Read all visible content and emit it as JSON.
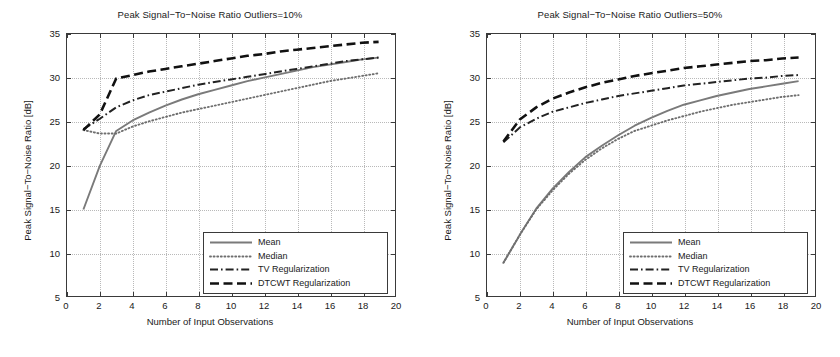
{
  "figure": {
    "width": 840,
    "height": 357,
    "background": "#ffffff"
  },
  "style": {
    "mean_color": "#7a7a7a",
    "median_color": "#6e6e6e",
    "tv_color": "#222222",
    "dtcwt_color": "#111111",
    "axis_color": "#3a3a3a",
    "grid_color": "#b9b9b9"
  },
  "axes": {
    "xlabel": "Number of Input Observations",
    "ylabel": "Peak Signal−To−Noise Ratio [dB]",
    "xlim": [
      0,
      20
    ],
    "ylim": [
      5,
      35
    ],
    "xticks": [
      0,
      2,
      4,
      6,
      8,
      10,
      12,
      14,
      16,
      18,
      20
    ],
    "yticks": [
      5,
      10,
      15,
      20,
      25,
      30,
      35
    ],
    "xtick_labels": [
      "0",
      "2",
      "4",
      "6",
      "8",
      "10",
      "12",
      "14",
      "16",
      "18",
      "20"
    ],
    "ytick_labels": [
      "5",
      "10",
      "15",
      "20",
      "25",
      "30",
      "35"
    ],
    "grid": true
  },
  "legend": {
    "position": "lower-right",
    "entries": [
      {
        "label": "Mean",
        "style": "solid"
      },
      {
        "label": "Median",
        "style": "dotted"
      },
      {
        "label": "TV Regularization",
        "style": "dashdot"
      },
      {
        "label": "DTCWT Regularization",
        "style": "dashed"
      }
    ]
  },
  "chart_data": [
    {
      "type": "line",
      "title": "Peak Signal−To−Noise Ratio Outliers=10%",
      "xlabel": "Number of Input Observations",
      "ylabel": "Peak Signal−To−Noise Ratio [dB]",
      "xlim": [
        0,
        20
      ],
      "ylim": [
        5,
        35
      ],
      "grid": true,
      "legend_position": "lower-right",
      "x": [
        1,
        2,
        3,
        4,
        5,
        6,
        7,
        8,
        9,
        10,
        11,
        12,
        13,
        14,
        15,
        16,
        17,
        18,
        19
      ],
      "series": [
        {
          "name": "Mean",
          "style": "solid",
          "color": "#7a7a7a",
          "values": [
            14.9,
            19.9,
            23.9,
            25.1,
            26.0,
            26.8,
            27.5,
            28.1,
            28.6,
            29.1,
            29.6,
            30.0,
            30.4,
            30.8,
            31.2,
            31.5,
            31.8,
            32.1,
            32.3
          ]
        },
        {
          "name": "Median",
          "style": "dotted",
          "color": "#6e6e6e",
          "values": [
            24.0,
            23.6,
            23.6,
            24.4,
            25.0,
            25.5,
            26.0,
            26.4,
            26.8,
            27.2,
            27.6,
            28.0,
            28.4,
            28.8,
            29.2,
            29.6,
            29.9,
            30.2,
            30.5
          ]
        },
        {
          "name": "TV Regularization",
          "style": "dashdot",
          "color": "#222222",
          "values": [
            24.1,
            25.3,
            26.6,
            27.4,
            28.0,
            28.4,
            28.8,
            29.2,
            29.5,
            29.8,
            30.1,
            30.4,
            30.7,
            31.0,
            31.3,
            31.6,
            31.9,
            32.1,
            32.3
          ]
        },
        {
          "name": "DTCWT Regularization",
          "style": "dashed",
          "color": "#111111",
          "values": [
            24.0,
            25.8,
            29.9,
            30.3,
            30.7,
            31.0,
            31.3,
            31.6,
            31.9,
            32.2,
            32.5,
            32.7,
            33.0,
            33.2,
            33.4,
            33.6,
            33.8,
            34.0,
            34.1
          ]
        }
      ]
    },
    {
      "type": "line",
      "title": "Peak Signal−To−Noise Ratio Outliers=50%",
      "xlabel": "Number of Input Observations",
      "ylabel": "Peak Signal−To−Noise Ratio [dB]",
      "xlim": [
        0,
        20
      ],
      "ylim": [
        5,
        35
      ],
      "grid": true,
      "legend_position": "lower-right",
      "x": [
        1,
        2,
        3,
        4,
        5,
        6,
        7,
        8,
        9,
        10,
        11,
        12,
        13,
        14,
        15,
        16,
        17,
        18,
        19
      ],
      "series": [
        {
          "name": "Mean",
          "style": "solid",
          "color": "#7a7a7a",
          "values": [
            8.8,
            12.0,
            15.0,
            17.3,
            19.2,
            20.9,
            22.2,
            23.4,
            24.5,
            25.4,
            26.2,
            26.9,
            27.4,
            27.9,
            28.3,
            28.7,
            29.0,
            29.3,
            29.6
          ]
        },
        {
          "name": "Median",
          "style": "dotted",
          "color": "#6e6e6e",
          "values": [
            8.8,
            12.0,
            14.9,
            17.1,
            19.0,
            20.6,
            21.9,
            23.0,
            23.9,
            24.5,
            25.1,
            25.6,
            26.1,
            26.5,
            26.9,
            27.2,
            27.5,
            27.8,
            28.0
          ]
        },
        {
          "name": "TV Regularization",
          "style": "dashdot",
          "color": "#222222",
          "values": [
            22.6,
            24.3,
            25.3,
            26.1,
            26.6,
            27.1,
            27.5,
            27.9,
            28.2,
            28.5,
            28.8,
            29.1,
            29.3,
            29.5,
            29.7,
            29.9,
            30.0,
            30.2,
            30.3
          ]
        },
        {
          "name": "DTCWT Regularization",
          "style": "dashed",
          "color": "#111111",
          "values": [
            22.7,
            25.2,
            26.6,
            27.6,
            28.3,
            28.9,
            29.4,
            29.8,
            30.2,
            30.5,
            30.8,
            31.1,
            31.3,
            31.5,
            31.7,
            31.9,
            32.0,
            32.2,
            32.3
          ]
        }
      ]
    }
  ]
}
